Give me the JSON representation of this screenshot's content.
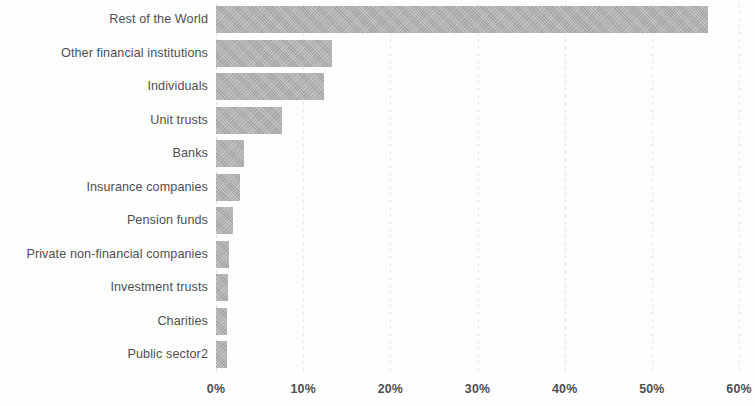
{
  "chart_data": {
    "type": "bar",
    "orientation": "horizontal",
    "title": "",
    "subtitle": "",
    "xlabel": "",
    "ylabel": "",
    "categories": [
      "Rest of the World",
      "Other financial institutions",
      "Individuals",
      "Unit trusts",
      "Banks",
      "Insurance companies",
      "Pension funds",
      "Private non-financial companies",
      "Investment trusts",
      "Charities",
      "Public sector2"
    ],
    "values": [
      56.5,
      13.3,
      12.4,
      7.6,
      3.2,
      2.8,
      1.9,
      1.5,
      1.4,
      1.3,
      1.3
    ],
    "value_unit": "%",
    "xlim": [
      0,
      60
    ],
    "xticks": [
      0,
      10,
      20,
      30,
      40,
      50,
      60
    ],
    "xtick_labels": [
      "0%",
      "10%",
      "20%",
      "30%",
      "40%",
      "50%",
      "60%"
    ],
    "grid": true,
    "grid_axis": "x",
    "legend": false,
    "bar_color": "#b3b3b3",
    "text_color": "#4e4e4e",
    "background_color": "#ffffff",
    "gridline_color": "#e3e3e3"
  }
}
